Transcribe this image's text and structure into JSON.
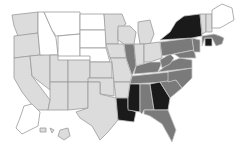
{
  "map": {
    "title": "",
    "type": "choropleth",
    "region": "United States",
    "legend_visible": false,
    "shades": {
      "none": "#ffffff",
      "low": "#dcdcdc",
      "mid": "#7a7a7a",
      "high": "#1a1a1a"
    },
    "states": [
      {
        "id": "WA",
        "shade": "low"
      },
      {
        "id": "OR",
        "shade": "low"
      },
      {
        "id": "CA",
        "shade": "low"
      },
      {
        "id": "ID",
        "shade": "none"
      },
      {
        "id": "NV",
        "shade": "low"
      },
      {
        "id": "MT",
        "shade": "none"
      },
      {
        "id": "WY",
        "shade": "none"
      },
      {
        "id": "UT",
        "shade": "low"
      },
      {
        "id": "AZ",
        "shade": "low"
      },
      {
        "id": "CO",
        "shade": "low"
      },
      {
        "id": "NM",
        "shade": "low"
      },
      {
        "id": "ND",
        "shade": "none"
      },
      {
        "id": "SD",
        "shade": "none"
      },
      {
        "id": "NE",
        "shade": "none"
      },
      {
        "id": "KS",
        "shade": "low"
      },
      {
        "id": "OK",
        "shade": "low"
      },
      {
        "id": "TX",
        "shade": "low"
      },
      {
        "id": "MN",
        "shade": "low"
      },
      {
        "id": "IA",
        "shade": "low"
      },
      {
        "id": "MO",
        "shade": "low"
      },
      {
        "id": "AR",
        "shade": "low"
      },
      {
        "id": "LA",
        "shade": "high"
      },
      {
        "id": "WI",
        "shade": "low"
      },
      {
        "id": "IL",
        "shade": "mid"
      },
      {
        "id": "MI",
        "shade": "low"
      },
      {
        "id": "IN",
        "shade": "low"
      },
      {
        "id": "OH",
        "shade": "low"
      },
      {
        "id": "KY",
        "shade": "mid"
      },
      {
        "id": "TN",
        "shade": "mid"
      },
      {
        "id": "MS",
        "shade": "high"
      },
      {
        "id": "AL",
        "shade": "mid"
      },
      {
        "id": "GA",
        "shade": "high"
      },
      {
        "id": "FL",
        "shade": "mid"
      },
      {
        "id": "SC",
        "shade": "mid"
      },
      {
        "id": "NC",
        "shade": "mid"
      },
      {
        "id": "VA",
        "shade": "mid"
      },
      {
        "id": "WV",
        "shade": "mid"
      },
      {
        "id": "PA",
        "shade": "mid"
      },
      {
        "id": "NY",
        "shade": "high"
      },
      {
        "id": "VT",
        "shade": "low"
      },
      {
        "id": "NH",
        "shade": "low"
      },
      {
        "id": "ME",
        "shade": "none"
      },
      {
        "id": "MA",
        "shade": "mid"
      },
      {
        "id": "CT",
        "shade": "high"
      },
      {
        "id": "NJ",
        "shade": "mid"
      },
      {
        "id": "MD",
        "shade": "mid"
      },
      {
        "id": "AK",
        "shade": "none"
      },
      {
        "id": "HI",
        "shade": "low"
      }
    ]
  }
}
